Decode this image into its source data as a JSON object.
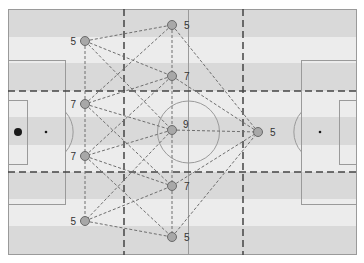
{
  "diagram": {
    "type": "soccer-tactical-passing-network",
    "colors": {
      "stripe_dark": "#d9d9d9",
      "stripe_light": "#ececec",
      "field_line": "#9a9a9a",
      "zone_line": "#444444",
      "pass_line": "#6e6e6e",
      "node_fill": "#a8a8a8",
      "node_stroke": "#6a6a6a",
      "ball": "#1a1a1a"
    },
    "nodes": [
      {
        "id": "LT",
        "x": 85,
        "y": 41,
        "label": "5",
        "label_side": "left"
      },
      {
        "id": "TC",
        "x": 172,
        "y": 25,
        "label": "5",
        "label_side": "right"
      },
      {
        "id": "CU",
        "x": 172,
        "y": 76,
        "label": "7",
        "label_side": "right"
      },
      {
        "id": "LU",
        "x": 85,
        "y": 104,
        "label": "7",
        "label_side": "left"
      },
      {
        "id": "C",
        "x": 172,
        "y": 130,
        "label": "9",
        "label_side": "right-up"
      },
      {
        "id": "R",
        "x": 258,
        "y": 132,
        "label": "5",
        "label_side": "right"
      },
      {
        "id": "LL",
        "x": 85,
        "y": 156,
        "label": "7",
        "label_side": "left"
      },
      {
        "id": "CL",
        "x": 172,
        "y": 186,
        "label": "7",
        "label_side": "right"
      },
      {
        "id": "LB",
        "x": 85,
        "y": 221,
        "label": "5",
        "label_side": "left"
      },
      {
        "id": "BC",
        "x": 172,
        "y": 237,
        "label": "5",
        "label_side": "right"
      }
    ],
    "edges": [
      [
        "LT",
        "TC"
      ],
      [
        "LT",
        "CU"
      ],
      [
        "LT",
        "C"
      ],
      [
        "LT",
        "LU"
      ],
      [
        "TC",
        "LU"
      ],
      [
        "TC",
        "CU"
      ],
      [
        "TC",
        "R"
      ],
      [
        "CU",
        "LU"
      ],
      [
        "CU",
        "LL"
      ],
      [
        "CU",
        "R"
      ],
      [
        "CU",
        "C"
      ],
      [
        "LU",
        "C"
      ],
      [
        "LU",
        "CL"
      ],
      [
        "LU",
        "LL"
      ],
      [
        "C",
        "R"
      ],
      [
        "C",
        "LL"
      ],
      [
        "C",
        "LB"
      ],
      [
        "C",
        "CL"
      ],
      [
        "LL",
        "CL"
      ],
      [
        "LL",
        "BC"
      ],
      [
        "LL",
        "LB"
      ],
      [
        "LB",
        "CL"
      ],
      [
        "LB",
        "BC"
      ],
      [
        "CL",
        "R"
      ],
      [
        "CL",
        "BC"
      ],
      [
        "BC",
        "R"
      ]
    ]
  }
}
